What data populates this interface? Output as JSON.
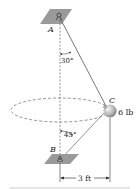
{
  "diagram": {
    "points": {
      "A": {
        "label": "A",
        "x": 60,
        "y": 17
      },
      "B": {
        "label": "B",
        "x": 60,
        "y": 160
      },
      "C": {
        "label": "C",
        "x": 108,
        "y": 110
      }
    },
    "angles": {
      "top": "30°",
      "bottom": "45°"
    },
    "weight_label": "6 lb",
    "dimension_label": "3 ft",
    "colors": {
      "plate": "#9a9a9a",
      "line": "#555555",
      "ball_light": "#f2f2f2",
      "ball_dark": "#6f6f6f"
    }
  }
}
